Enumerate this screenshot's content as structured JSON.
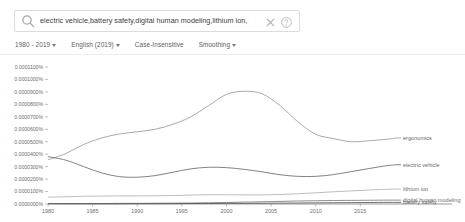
{
  "search": {
    "value": "electric vehicle,battery safety,digital human modeling,lithium ion,",
    "placeholder": "Search in Google Books",
    "search_icon": "search-icon",
    "clear_icon": "close-icon",
    "help_icon": "help-circle-icon"
  },
  "controls": {
    "year_range": "1980 - 2019",
    "corpus": "English (2019)",
    "case": "Case-Insensitive",
    "smoothing": "Smoothing"
  },
  "chart_data": {
    "type": "line",
    "title": "",
    "xlabel": "",
    "ylabel": "",
    "grid": false,
    "legend_position": "right",
    "xlim": [
      1980,
      2019
    ],
    "ylim": [
      0.0,
      0.00011
    ],
    "xticks": [
      1980,
      1985,
      1990,
      1995,
      2000,
      2005,
      2010,
      2015
    ],
    "xticklabels": [
      "1980",
      "1985",
      "1990",
      "1995",
      "2000",
      "2005",
      "2010",
      "2015"
    ],
    "yticks": [
      0.00011,
      0.0001,
      9e-05,
      8e-05,
      7e-05,
      6e-05,
      5e-05,
      4e-05,
      3e-05,
      2e-05,
      1e-05,
      0.0
    ],
    "yticklabels": [
      "0.0001100%",
      "0.0001000%",
      "0.0000900%",
      "0.0000800%",
      "0.0000700%",
      "0.0000600%",
      "0.0000500%",
      "0.0000400%",
      "0.0000300%",
      "0.0000200%",
      "0.0000100%",
      "0.0000000%"
    ],
    "x": [
      1980,
      1982,
      1984,
      1986,
      1988,
      1990,
      1992,
      1994,
      1996,
      1998,
      2000,
      2002,
      2004,
      2006,
      2008,
      2010,
      2012,
      2014,
      2016,
      2018,
      2019
    ],
    "series": [
      {
        "name": "ergonomics",
        "color": "#9a9a9a",
        "values": [
          3.55e-05,
          4.05e-05,
          4.78e-05,
          5.3e-05,
          5.62e-05,
          5.8e-05,
          6e-05,
          6.4e-05,
          7e-05,
          7.9e-05,
          8.8e-05,
          9.05e-05,
          8.85e-05,
          7.9e-05,
          6.6e-05,
          5.6e-05,
          5.25e-05,
          5e-05,
          5.08e-05,
          5.2e-05,
          5.3e-05
        ]
      },
      {
        "name": "electric vehicle",
        "color": "#6b6b6b",
        "values": [
          3.8e-05,
          3.52e-05,
          3e-05,
          2.5e-05,
          2.2e-05,
          2.15e-05,
          2.28e-05,
          2.55e-05,
          2.82e-05,
          2.95e-05,
          2.92e-05,
          2.78e-05,
          2.58e-05,
          2.35e-05,
          2.22e-05,
          2.22e-05,
          2.36e-05,
          2.6e-05,
          2.85e-05,
          3.08e-05,
          3.15e-05
        ]
      },
      {
        "name": "lithium ion",
        "color": "#b0b0b0",
        "values": [
          5.5e-06,
          5.8e-06,
          6.2e-06,
          6.4e-06,
          6.5e-06,
          6.5e-06,
          6.6e-06,
          6.8e-06,
          7.2e-06,
          7.4e-06,
          7.4e-06,
          7.3e-06,
          7.3e-06,
          7.6e-06,
          8.2e-06,
          9e-06,
          9.8e-06,
          1.05e-05,
          1.12e-05,
          1.18e-05,
          1.2e-05
        ]
      },
      {
        "name": "digital human modeling",
        "color": "#7a7a7a",
        "values": [
          4e-07,
          4e-07,
          4e-07,
          4e-07,
          5e-07,
          5e-07,
          6e-07,
          7e-07,
          8e-07,
          1e-06,
          1.2e-06,
          1.5e-06,
          1.8e-06,
          2.1e-06,
          2.4e-06,
          2.6e-06,
          2.8e-06,
          2.9e-06,
          3e-06,
          3.1e-06,
          3.1e-06
        ]
      },
      {
        "name": "battery safety",
        "color": "#565656",
        "values": [
          2e-07,
          2e-07,
          2e-07,
          2e-07,
          2e-07,
          3e-07,
          3e-07,
          3e-07,
          4e-07,
          4e-07,
          5e-07,
          5e-07,
          6e-07,
          7e-07,
          8e-07,
          9e-07,
          1e-06,
          1.1e-06,
          1.2e-06,
          1.3e-06,
          1.3e-06
        ]
      }
    ]
  }
}
